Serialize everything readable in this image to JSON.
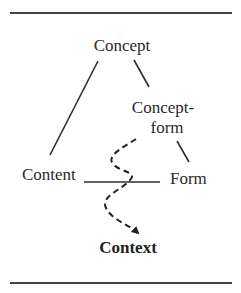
{
  "diagram": {
    "nodes": {
      "concept": "Concept",
      "concept_form_line1": "Concept-",
      "concept_form_line2": "form",
      "content": "Content",
      "form": "Form",
      "context": "Context"
    },
    "edges": [
      {
        "from": "Concept",
        "to": "Content",
        "style": "solid"
      },
      {
        "from": "Concept",
        "to": "Concept-form",
        "style": "solid"
      },
      {
        "from": "Concept-form",
        "to": "Form",
        "style": "solid"
      },
      {
        "from": "Content",
        "to": "Form",
        "style": "solid"
      },
      {
        "from": "Concept-form",
        "to": "Context",
        "style": "dashed-arrow"
      }
    ],
    "colors": {
      "ink": "#2a2a2a",
      "background": "#ffffff"
    }
  }
}
